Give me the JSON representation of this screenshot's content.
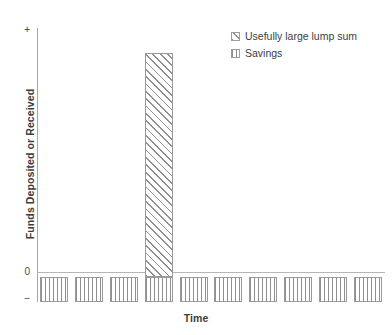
{
  "chart_data": {
    "type": "bar",
    "title": "",
    "subtitle": "",
    "xlabel": "Time",
    "ylabel": "Funds Deposited or Received",
    "grid": false,
    "legend_position": "top-right",
    "x_tick_labels": [],
    "y_tick_labels": [
      "+",
      "0",
      "−"
    ],
    "ylim": [
      -1,
      10
    ],
    "x_categories": [
      "1",
      "2",
      "3",
      "4",
      "5",
      "6",
      "7",
      "8",
      "9",
      "10"
    ],
    "series": [
      {
        "name": "Usefully large lump sum",
        "pattern": "diagonal-hatch",
        "color": "#8f8f8f",
        "values": [
          0,
          0,
          0,
          9.0,
          0,
          0,
          0,
          0,
          0,
          0
        ]
      },
      {
        "name": "Savings",
        "pattern": "vertical-stripes",
        "color": "#8f8f8f",
        "values": [
          -1,
          -1,
          -1,
          -1,
          -1,
          -1,
          -1,
          -1,
          -1,
          -1
        ]
      }
    ],
    "annotations": []
  },
  "axes": {
    "y_top_label": "+",
    "y_zero_label": "0",
    "y_bottom_label": "−",
    "y_title": "Funds Deposited or Received",
    "x_title": "Time"
  },
  "legend": {
    "items": [
      {
        "label": "Usefully large lump sum",
        "swatch": "diagonal-hatch-swatch"
      },
      {
        "label": "Savings",
        "swatch": "vertical-stripe-swatch"
      }
    ]
  },
  "colors": {
    "axis": "#a6a6a6",
    "zero_line": "#b5b5b5",
    "bar_outline": "#9a9a9a",
    "hatch": "#8f8f8f",
    "text": "#3d3d3d",
    "background": "#ffffff"
  }
}
